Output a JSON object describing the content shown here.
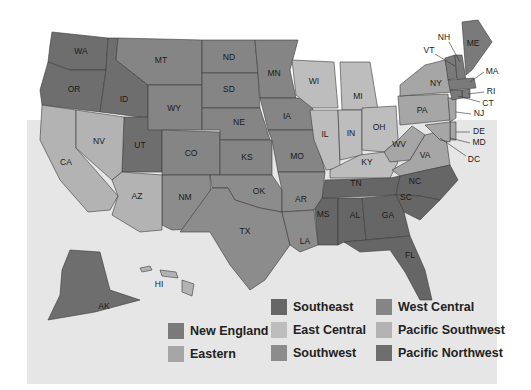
{
  "map": {
    "title": "",
    "colors": {
      "new_england": "#7a7a7a",
      "eastern": "#a6a6a6",
      "southeast": "#666666",
      "east_central": "#bdbdbd",
      "southwest": "#8c8c8c",
      "west_central": "#858585",
      "pacific_southwest": "#b3b3b3",
      "pacific_northwest": "#6e6e6e"
    },
    "states": {
      "WA": "WA",
      "OR": "OR",
      "CA": "CA",
      "NV": "NV",
      "ID": "ID",
      "MT": "MT",
      "WY": "WY",
      "UT": "UT",
      "AZ": "AZ",
      "CO": "CO",
      "NM": "NM",
      "ND": "ND",
      "SD": "SD",
      "NE": "NE",
      "KS": "KS",
      "OK": "OK",
      "TX": "TX",
      "MN": "MN",
      "IA": "IA",
      "MO": "MO",
      "AR": "AR",
      "LA": "LA",
      "WI": "WI",
      "IL": "IL",
      "MI": "MI",
      "IN": "IN",
      "OH": "OH",
      "KY": "KY",
      "TN": "TN",
      "MS": "MS",
      "AL": "AL",
      "GA": "GA",
      "FL": "FL",
      "SC": "SC",
      "NC": "NC",
      "VA": "VA",
      "WV": "WV",
      "PA": "PA",
      "NY": "NY",
      "VT": "VT",
      "NH": "NH",
      "ME": "ME",
      "MA": "MA",
      "RI": "RI",
      "CT": "CT",
      "NJ": "NJ",
      "DE": "DE",
      "MD": "MD",
      "DC": "DC",
      "AK": "AK",
      "HI": "HI"
    }
  },
  "legend": {
    "items": [
      {
        "label": "New England"
      },
      {
        "label": "Eastern"
      },
      {
        "label": "Southeast"
      },
      {
        "label": "East Central"
      },
      {
        "label": "Southwest"
      },
      {
        "label": "West Central"
      },
      {
        "label": "Pacific Southwest"
      },
      {
        "label": "Pacific Northwest"
      }
    ]
  }
}
